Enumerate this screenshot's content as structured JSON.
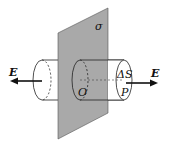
{
  "diagram": {
    "labels": {
      "plane": "σ",
      "field_left": "E",
      "field_right": "E",
      "origin": "O",
      "area": "ΔS",
      "point": "P"
    },
    "colors": {
      "plane_fill": "#a9a9a9",
      "stroke": "#222222",
      "background": "#ffffff"
    }
  }
}
